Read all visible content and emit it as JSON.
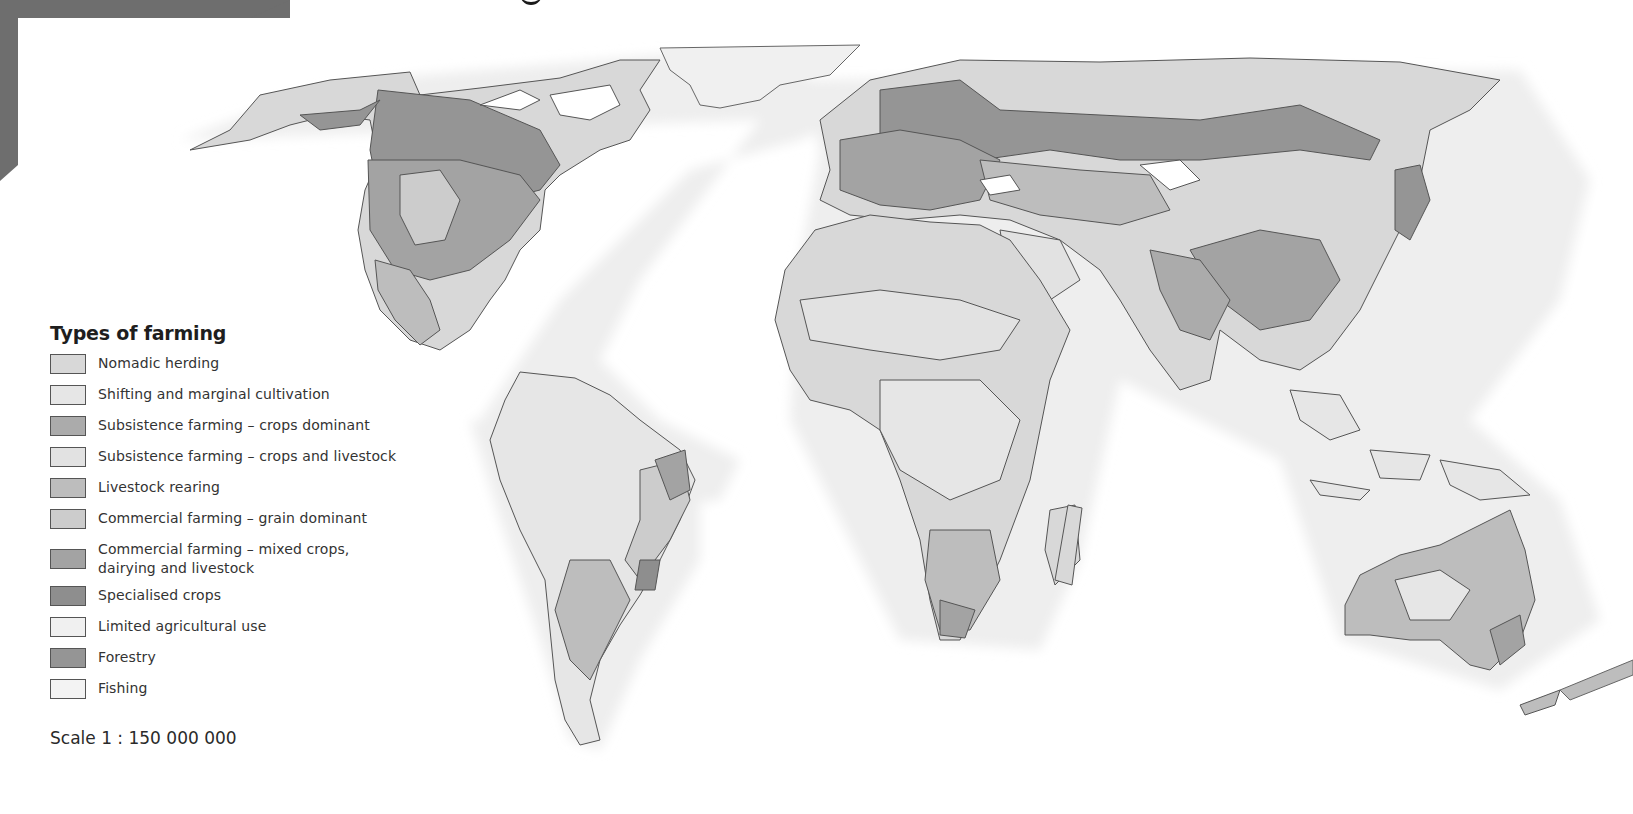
{
  "page": {
    "title_fragment": "",
    "band_color": "#6e6e6e"
  },
  "legend": {
    "title": "Types of farming",
    "items": [
      {
        "label": "Nomadic herding",
        "color": "#d8d8d8"
      },
      {
        "label": "Shifting and marginal cultivation",
        "color": "#e6e6e6"
      },
      {
        "label": "Subsistence farming – crops dominant",
        "color": "#ababab"
      },
      {
        "label": "Subsistence farming – crops and livestock",
        "color": "#e2e2e2"
      },
      {
        "label": "Livestock rearing",
        "color": "#bdbdbd"
      },
      {
        "label": "Commercial farming – grain dominant",
        "color": "#cccccc"
      },
      {
        "label": "Commercial farming – mixed crops, dairying and livestock",
        "line1": "Commercial farming – mixed crops,",
        "line2": "dairying and livestock",
        "color": "#a3a3a3"
      },
      {
        "label": "Specialised crops",
        "color": "#8e8e8e"
      },
      {
        "label": "Limited agricultural use",
        "color": "#f0f0f0"
      },
      {
        "label": "Forestry",
        "color": "#959595"
      },
      {
        "label": "Fishing",
        "color": "#f3f3f3"
      }
    ]
  },
  "scale": {
    "label": "Scale 1 : 150 000 000"
  },
  "map": {
    "ocean_color": "#ffffff",
    "coastal_shelf_color": "#eeeeee",
    "border_color": "#555555"
  }
}
